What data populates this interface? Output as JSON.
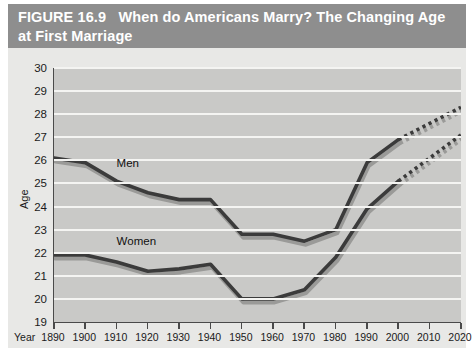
{
  "header": {
    "figure_number": "FIGURE 16.9",
    "title": "When do Americans Marry? The Changing Age at First Marriage",
    "band_color": "#8e8e8e",
    "text_color": "#ffffff"
  },
  "chart_data": {
    "type": "line",
    "title": "When do Americans Marry? The Changing Age at First Marriage",
    "xlabel": "Year",
    "ylabel": "Age",
    "x": [
      1890,
      1900,
      1910,
      1920,
      1930,
      1940,
      1950,
      1960,
      1970,
      1980,
      1990,
      2000,
      2010,
      2020
    ],
    "xlim": [
      1890,
      2020
    ],
    "ylim": [
      19,
      30
    ],
    "ytick_labels": [
      "30",
      "29",
      "28",
      "27",
      "26",
      "25",
      "24",
      "23",
      "22",
      "21",
      "20",
      "19"
    ],
    "xtick_labels": [
      "1890",
      "1900",
      "1910",
      "1920",
      "1930",
      "1940",
      "1950",
      "1960",
      "1970",
      "1980",
      "1990",
      "2000",
      "2010",
      "2020"
    ],
    "grid": true,
    "grid_color": "#f4f4f2",
    "plot_background": "#c9c9c7",
    "legend": "inline-labels",
    "series": [
      {
        "name": "Men",
        "label": "Men",
        "color": "#3b3b3b",
        "shadow_color": "#9a9a98",
        "values": [
          26.1,
          25.9,
          25.1,
          24.6,
          24.3,
          24.3,
          22.8,
          22.8,
          22.5,
          23.0,
          25.9,
          26.9,
          27.6,
          28.3
        ],
        "solid_through": 2000,
        "projected_from": 2000,
        "projection_style": "dotted"
      },
      {
        "name": "Women",
        "label": "Women",
        "color": "#3b3b3b",
        "shadow_color": "#9a9a98",
        "values": [
          21.9,
          21.9,
          21.6,
          21.2,
          21.3,
          21.5,
          20.0,
          20.0,
          20.4,
          21.8,
          23.9,
          25.1,
          26.1,
          27.1
        ],
        "solid_through": 2000,
        "projected_from": 2000,
        "projection_style": "dotted"
      }
    ],
    "annotations": [
      {
        "text": "Men",
        "x": 1910,
        "y": 25.6
      },
      {
        "text": "Women",
        "x": 1910,
        "y": 22.2
      }
    ]
  }
}
